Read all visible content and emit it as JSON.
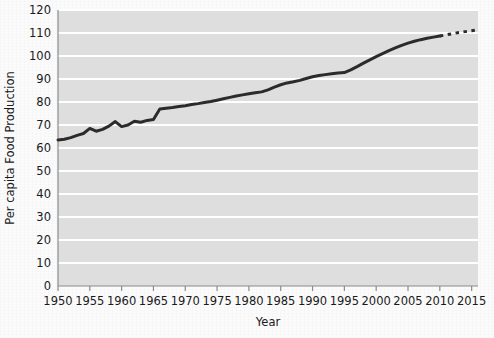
{
  "chart_data": {
    "type": "line",
    "title": "",
    "xlabel": "Year",
    "ylabel": "Per capita Food Production",
    "xlim": [
      1950,
      2016
    ],
    "ylim": [
      0,
      120
    ],
    "grid": true,
    "legend": "none",
    "xticks": [
      1950,
      1955,
      1960,
      1965,
      1970,
      1975,
      1980,
      1985,
      1990,
      1995,
      2000,
      2005,
      2010,
      2015
    ],
    "xtick_labels": [
      "1950",
      "1955",
      "1960",
      "1965",
      "1970",
      "1975",
      "1980",
      "1985",
      "1990",
      "1995",
      "2000",
      "2005",
      "2010",
      "2015"
    ],
    "yticks": [
      0,
      10,
      20,
      30,
      40,
      50,
      60,
      70,
      80,
      90,
      100,
      110,
      120
    ],
    "ytick_labels": [
      "0",
      "10",
      "20",
      "30",
      "40",
      "50",
      "60",
      "70",
      "80",
      "90",
      "100",
      "110",
      "120"
    ],
    "series": [
      {
        "name": "Per capita Food Production (observed)",
        "style": "solid",
        "color": "#2b2b2b",
        "x": [
          1950,
          1951,
          1952,
          1953,
          1954,
          1955,
          1956,
          1957,
          1958,
          1959,
          1960,
          1961,
          1962,
          1963,
          1964,
          1965,
          1966,
          1967,
          1968,
          1969,
          1970,
          1971,
          1972,
          1973,
          1974,
          1975,
          1976,
          1977,
          1978,
          1979,
          1980,
          1981,
          1982,
          1983,
          1984,
          1985,
          1986,
          1987,
          1988,
          1989,
          1990,
          1991,
          1992,
          1993,
          1994,
          1995,
          1996,
          1997,
          1998,
          1999,
          2000,
          2001,
          2002,
          2003,
          2004,
          2005,
          2006,
          2007,
          2008,
          2009,
          2010
        ],
        "y": [
          63.5,
          63.8,
          64.5,
          65.5,
          66.3,
          68.5,
          67.3,
          68.1,
          69.5,
          71.5,
          69.3,
          70.0,
          71.6,
          71.2,
          72.0,
          72.4,
          77.0,
          77.3,
          77.6,
          78.0,
          78.4,
          78.9,
          79.3,
          79.8,
          80.2,
          80.8,
          81.4,
          82.0,
          82.6,
          83.1,
          83.6,
          84.0,
          84.4,
          85.3,
          86.5,
          87.5,
          88.3,
          88.8,
          89.4,
          90.2,
          91.0,
          91.5,
          91.9,
          92.3,
          92.6,
          92.8,
          94.0,
          95.4,
          96.9,
          98.3,
          99.7,
          101.0,
          102.3,
          103.5,
          104.6,
          105.6,
          106.4,
          107.1,
          107.7,
          108.2,
          108.7
        ]
      },
      {
        "name": "Per capita Food Production (projected)",
        "style": "dashed",
        "color": "#2b2b2b",
        "x": [
          2010,
          2011,
          2012,
          2013,
          2014,
          2015,
          2016
        ],
        "y": [
          108.7,
          109.2,
          109.7,
          110.2,
          110.6,
          111.0,
          111.4
        ]
      }
    ]
  },
  "axes": {
    "plot_bg_color": "#dedede",
    "grid_color": "#ffffff",
    "axis_line_color": "#8c8c8c"
  }
}
